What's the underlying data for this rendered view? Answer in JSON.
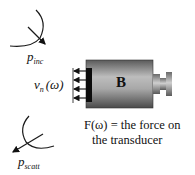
{
  "diagram": {
    "incident_wave": {
      "symbol": "p",
      "subscript": "inc",
      "icon": "incident-wavefront-arrow-icon"
    },
    "scattered_wave": {
      "symbol": "p",
      "subscript": "scatt",
      "icon": "scattered-wavefront-arrow-icon"
    },
    "velocity_label": {
      "symbol": "v",
      "subscript": "n",
      "argument": "(ω)"
    },
    "transducer": {
      "label": "B",
      "arrow_count": 4
    },
    "caption": {
      "line1": "F(ω) =  the force on",
      "line2": "the transducer"
    },
    "colors": {
      "line": "#1a1a1a",
      "body_light": "#d8d8d8",
      "body_dark": "#6a6a6a",
      "face": "#0d0d0d"
    }
  }
}
